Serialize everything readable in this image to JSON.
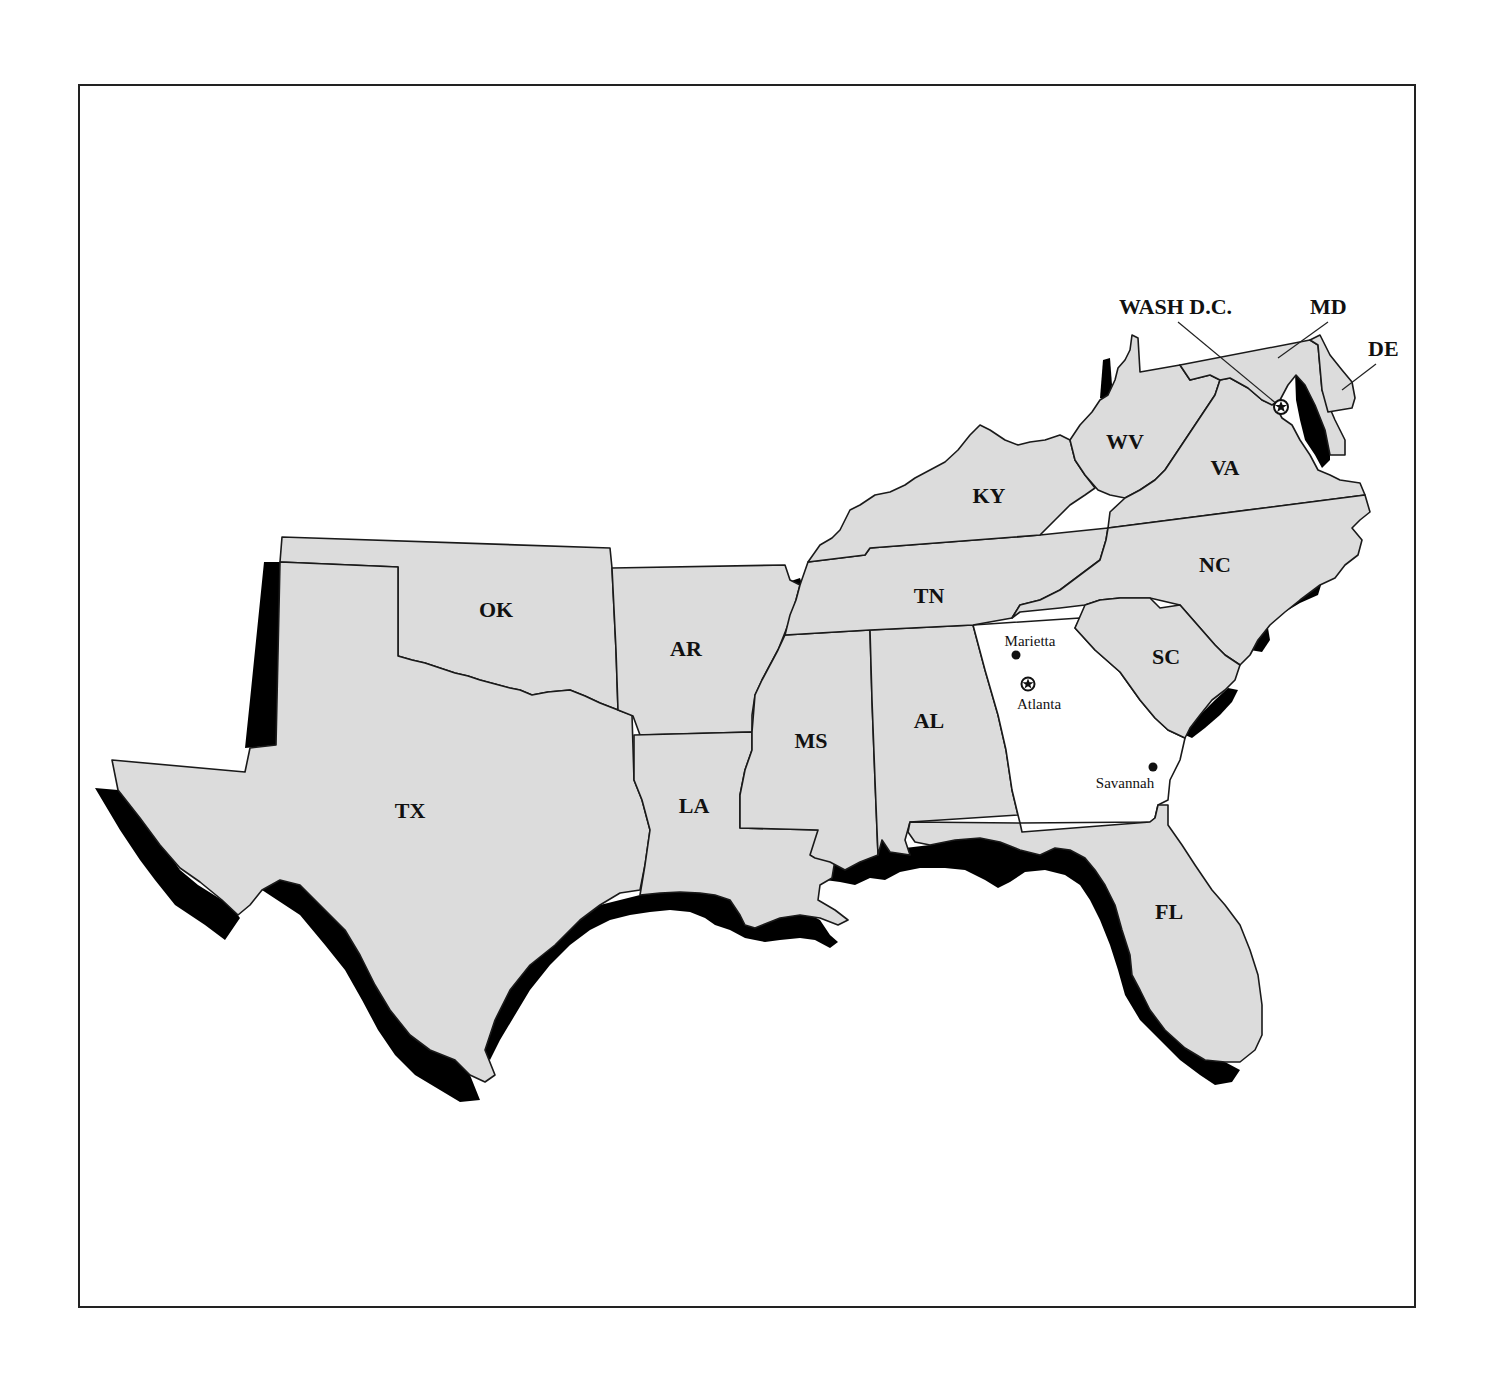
{
  "map": {
    "colors": {
      "state_fill": "#dcdcdc",
      "highlight_fill": "#ffffff",
      "shadow": "#000000",
      "border": "#1a1a1a",
      "background": "#ffffff"
    },
    "states": [
      {
        "abbr": "TX",
        "label": "TX"
      },
      {
        "abbr": "OK",
        "label": "OK"
      },
      {
        "abbr": "AR",
        "label": "AR"
      },
      {
        "abbr": "LA",
        "label": "LA"
      },
      {
        "abbr": "MS",
        "label": "MS"
      },
      {
        "abbr": "AL",
        "label": "AL"
      },
      {
        "abbr": "TN",
        "label": "TN"
      },
      {
        "abbr": "KY",
        "label": "KY"
      },
      {
        "abbr": "WV",
        "label": "WV"
      },
      {
        "abbr": "VA",
        "label": "VA"
      },
      {
        "abbr": "NC",
        "label": "NC"
      },
      {
        "abbr": "SC",
        "label": "SC"
      },
      {
        "abbr": "FL",
        "label": "FL"
      },
      {
        "abbr": "GA",
        "label": "",
        "highlighted": true
      }
    ],
    "callouts": [
      {
        "label": "WASH D.C."
      },
      {
        "label": "MD"
      },
      {
        "label": "DE"
      }
    ],
    "cities": [
      {
        "name": "Marietta",
        "marker": "dot"
      },
      {
        "name": "Atlanta",
        "marker": "star-capital"
      },
      {
        "name": "Savannah",
        "marker": "dot"
      }
    ],
    "dc_marker": "star-capital"
  }
}
